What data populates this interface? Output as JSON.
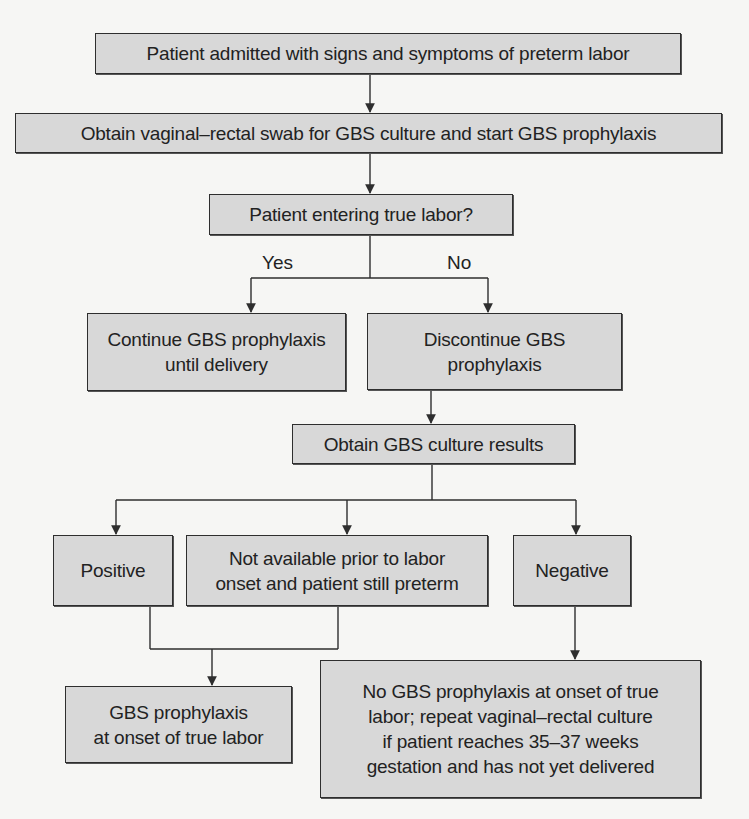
{
  "diagram": {
    "type": "flowchart",
    "nodes": {
      "admitted": "Patient admitted with signs and symptoms of preterm labor",
      "swab": "Obtain vaginal–rectal swab for GBS culture and start GBS prophylaxis",
      "true_labor_question": "Patient entering true labor?",
      "continue": "Continue GBS prophylaxis\nuntil delivery",
      "discontinue": "Discontinue GBS\nprophylaxis",
      "culture_results": "Obtain GBS culture results",
      "positive": "Positive",
      "not_available": "Not available prior to labor\nonset and patient still preterm",
      "negative": "Negative",
      "prophylaxis_onset": "GBS prophylaxis\nat onset of true labor",
      "no_prophylaxis": "No GBS prophylaxis at onset of true\nlabor; repeat vaginal–rectal culture\nif patient reaches 35–37 weeks\ngestation and has not yet delivered"
    },
    "edge_labels": {
      "yes": "Yes",
      "no": "No"
    },
    "edges": [
      [
        "admitted",
        "swab"
      ],
      [
        "swab",
        "true_labor_question"
      ],
      [
        "true_labor_question",
        "continue",
        "Yes"
      ],
      [
        "true_labor_question",
        "discontinue",
        "No"
      ],
      [
        "discontinue",
        "culture_results"
      ],
      [
        "culture_results",
        "positive"
      ],
      [
        "culture_results",
        "not_available"
      ],
      [
        "culture_results",
        "negative"
      ],
      [
        "positive",
        "prophylaxis_onset"
      ],
      [
        "not_available",
        "prophylaxis_onset"
      ],
      [
        "negative",
        "no_prophylaxis"
      ]
    ],
    "colors": {
      "box_fill": "#d8d8d8",
      "box_border": "#2e2e2e",
      "line": "#2e2e2e",
      "background": "#f6f6f4"
    }
  }
}
